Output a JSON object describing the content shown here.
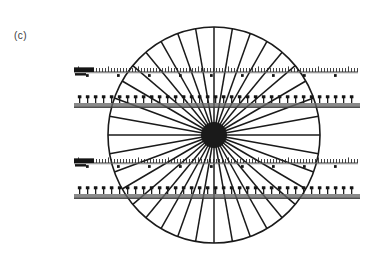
{
  "figure": {
    "panel_label": "(c)",
    "background_color": "#ffffff",
    "ink_color": "#1a1a1a",
    "ruler_gray": "#9a9a9a",
    "ruler_dark": "#2b2b2b"
  },
  "chart_data": {
    "type": "scatter",
    "title": "(c)",
    "subtitle": "",
    "xlabel": "",
    "ylabel": "",
    "grid": false,
    "legend_position": "none",
    "annotations": [
      "(c)"
    ],
    "wheel": {
      "center_x": 214,
      "center_y": 135,
      "radius_x": 106,
      "radius_y": 108,
      "spoke_count": 36,
      "spoke_angle_step_deg": 10,
      "hub_radius": 13,
      "rim_stroke_width": 1.6,
      "spoke_stroke_width": 1.5
    },
    "strips": [
      {
        "id": "strip-1",
        "style": "fine-ruler",
        "y": 72,
        "x_start": 74,
        "x_end": 358,
        "baseline_color": "#8e8e8e",
        "tick_count": 95,
        "tick_spacing": 3,
        "tick_height": 4,
        "major_every": 10,
        "marker_count": 10,
        "marker_spacing": 31,
        "left_blob_width": 20
      },
      {
        "id": "strip-2",
        "style": "bar-ruler",
        "y": 103,
        "x_start": 74,
        "x_end": 360,
        "bar_color": "#8a8a8a",
        "bar_height": 5,
        "tick_count": 37,
        "tick_spacing": 8,
        "tick_height": 5,
        "marker_count": 37
      },
      {
        "id": "strip-3",
        "style": "fine-ruler",
        "y": 163,
        "x_start": 74,
        "x_end": 358,
        "baseline_color": "#8e8e8e",
        "tick_count": 95,
        "tick_spacing": 3,
        "tick_height": 4,
        "major_every": 10,
        "marker_count": 10,
        "marker_spacing": 31,
        "left_blob_width": 20
      },
      {
        "id": "strip-4",
        "style": "bar-ruler",
        "y": 194,
        "x_start": 74,
        "x_end": 360,
        "bar_color": "#8a8a8a",
        "bar_height": 5,
        "tick_count": 37,
        "tick_spacing": 8,
        "tick_height": 5,
        "marker_count": 37
      }
    ]
  }
}
